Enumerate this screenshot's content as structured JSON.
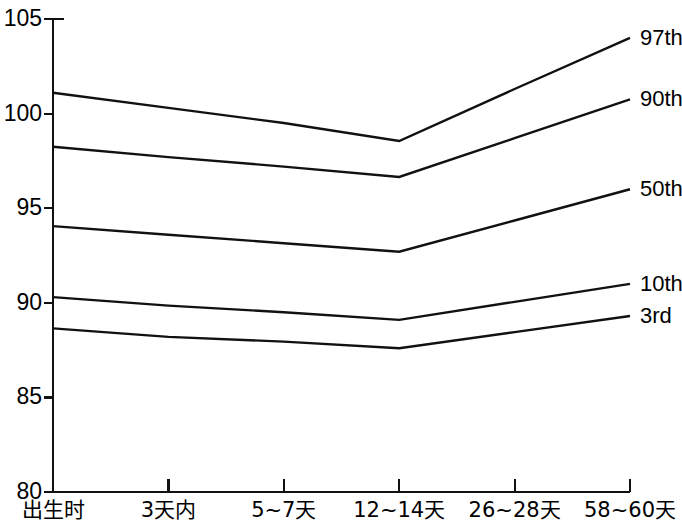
{
  "chart_data": {
    "type": "line",
    "title": "",
    "subtitle": "",
    "xlabel": "",
    "ylabel": "",
    "grid": false,
    "legend_position": "right-inline",
    "x": [
      "出生时",
      "3天内",
      "5~7天",
      "12~14天",
      "26~28天",
      "58~60天"
    ],
    "categories": [
      "出生时",
      "3天内",
      "5~7天",
      "12~14天",
      "26~28天",
      "58~60天"
    ],
    "ylim": [
      80,
      105
    ],
    "xlim": [
      0,
      5
    ],
    "yticks": [
      80,
      85,
      90,
      95,
      100,
      105
    ],
    "ytick_labels": [
      "80",
      "85",
      "90",
      "95",
      "100",
      "105"
    ],
    "series": [
      {
        "name": "97th",
        "label": "97th",
        "values": [
          101.1,
          100.3,
          99.5,
          98.55,
          101.3,
          104.0
        ]
      },
      {
        "name": "90th",
        "label": "90th",
        "values": [
          98.25,
          97.7,
          97.2,
          96.65,
          98.7,
          100.75
        ]
      },
      {
        "name": "50th",
        "label": "50th",
        "values": [
          94.05,
          93.6,
          93.15,
          92.7,
          94.35,
          96.0
        ]
      },
      {
        "name": "10th",
        "label": "10th",
        "values": [
          90.3,
          89.85,
          89.5,
          89.1,
          90.05,
          91.0
        ]
      },
      {
        "name": "3rd",
        "label": "3rd",
        "values": [
          88.65,
          88.2,
          87.95,
          87.6,
          88.45,
          89.3
        ]
      }
    ]
  },
  "axes": {
    "y_labels": [
      "105",
      "100",
      "95",
      "90",
      "85",
      "80"
    ],
    "x_labels": [
      "出生时",
      "3天内",
      "5~7天",
      "12~14天",
      "26~28天",
      "58~60天"
    ]
  },
  "legend": {
    "items": [
      "97th",
      "90th",
      "50th",
      "10th",
      "3rd"
    ]
  },
  "colors": {
    "line": "#111111",
    "axis": "#111111",
    "background": "#ffffff",
    "text": "#000000"
  }
}
